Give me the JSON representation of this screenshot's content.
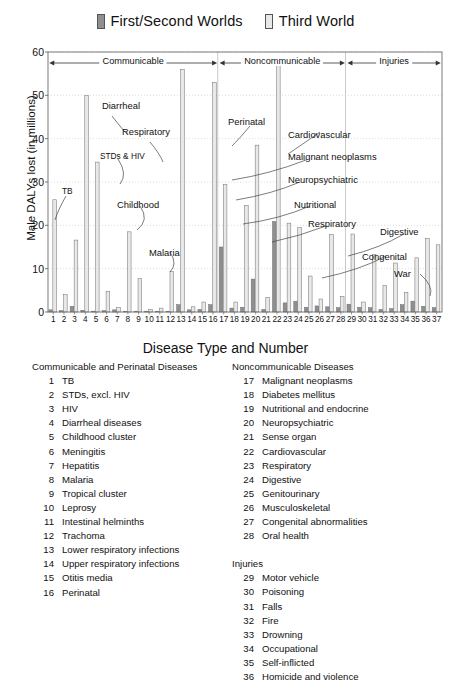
{
  "legend": {
    "items": [
      {
        "label": "First/Second Worlds",
        "color": "#8f8f8f",
        "icon": "legend-swatch-dark"
      },
      {
        "label": "Third World",
        "color": "#e8e8e8",
        "icon": "legend-swatch-light"
      }
    ]
  },
  "axis_title_x": "Disease Type and Number",
  "axis_title_y": "Male DALYs lost (in millions)",
  "bands": [
    {
      "label": "Communicable",
      "from": 1,
      "to": 16
    },
    {
      "label": "Noncommunicable",
      "from": 17,
      "to": 28
    },
    {
      "label": "Injuries",
      "from": 29,
      "to": 37
    }
  ],
  "annotations": [
    {
      "label": "TB",
      "x": 62,
      "y": 186
    },
    {
      "label": "Diarrheal",
      "x": 102,
      "y": 100
    },
    {
      "label": "Respiratory",
      "x": 122,
      "y": 126
    },
    {
      "label": "STDs & HIV",
      "x": 100,
      "y": 151
    },
    {
      "label": "Childhood",
      "x": 117,
      "y": 199
    },
    {
      "label": "Malaria",
      "x": 149,
      "y": 247
    },
    {
      "label": "Perinatal",
      "x": 228,
      "y": 116
    },
    {
      "label": "Cardiovascular",
      "x": 288,
      "y": 129
    },
    {
      "label": "Malignant neoplasms",
      "x": 288,
      "y": 151
    },
    {
      "label": "Neuropsychiatric",
      "x": 288,
      "y": 174
    },
    {
      "label": "Nutritional",
      "x": 294,
      "y": 199
    },
    {
      "label": "Respiratory",
      "x": 308,
      "y": 218
    },
    {
      "label": "Digestive",
      "x": 380,
      "y": 226
    },
    {
      "label": "Congenital",
      "x": 362,
      "y": 251
    },
    {
      "label": "War",
      "x": 394,
      "y": 268
    }
  ],
  "lists": {
    "left": {
      "heading": "Communicable and Perinatal Diseases",
      "items": [
        {
          "num": "1",
          "name": "TB"
        },
        {
          "num": "2",
          "name": "STDs, excl. HIV"
        },
        {
          "num": "3",
          "name": "HIV"
        },
        {
          "num": "4",
          "name": "Diarrheal diseases"
        },
        {
          "num": "5",
          "name": "Childhood cluster"
        },
        {
          "num": "6",
          "name": "Meningitis"
        },
        {
          "num": "7",
          "name": "Hepatitis"
        },
        {
          "num": "8",
          "name": "Malaria"
        },
        {
          "num": "9",
          "name": "Tropical cluster"
        },
        {
          "num": "10",
          "name": "Leprosy"
        },
        {
          "num": "11",
          "name": "Intestinal helminths"
        },
        {
          "num": "12",
          "name": "Trachoma"
        },
        {
          "num": "13",
          "name": "Lower respiratory infections"
        },
        {
          "num": "14",
          "name": "Upper respiratory infections"
        },
        {
          "num": "15",
          "name": "Otitis media"
        },
        {
          "num": "16",
          "name": "Perinatal"
        }
      ]
    },
    "right": {
      "heading": "Noncommunicable Diseases",
      "items": [
        {
          "num": "17",
          "name": "Malignant neoplasms"
        },
        {
          "num": "18",
          "name": "Diabetes mellitus"
        },
        {
          "num": "19",
          "name": "Nutritional and endocrine"
        },
        {
          "num": "20",
          "name": "Neuropsychiatric"
        },
        {
          "num": "21",
          "name": "Sense organ"
        },
        {
          "num": "22",
          "name": "Cardiovascular"
        },
        {
          "num": "23",
          "name": "Respiratory"
        },
        {
          "num": "24",
          "name": "Digestive"
        },
        {
          "num": "25",
          "name": "Genitourinary"
        },
        {
          "num": "26",
          "name": "Musculoskeletal"
        },
        {
          "num": "27",
          "name": "Congenital abnormalities"
        },
        {
          "num": "28",
          "name": "Oral health"
        }
      ],
      "heading2": "Injuries",
      "items2": [
        {
          "num": "29",
          "name": "Motor vehicle"
        },
        {
          "num": "30",
          "name": "Poisoning"
        },
        {
          "num": "31",
          "name": "Falls"
        },
        {
          "num": "32",
          "name": "Fire"
        },
        {
          "num": "33",
          "name": "Drowning"
        },
        {
          "num": "34",
          "name": "Occupational"
        },
        {
          "num": "35",
          "name": "Self-inflicted"
        },
        {
          "num": "36",
          "name": "Homicide and violence"
        }
      ]
    }
  },
  "chart_data": {
    "type": "bar",
    "title": "",
    "xlabel": "Disease Type and Number",
    "ylabel": "Male DALYs lost (in millions)",
    "ylim": [
      0,
      60
    ],
    "yticks": [
      0,
      10,
      20,
      30,
      40,
      50,
      60
    ],
    "grid": true,
    "legend_position": "top-center",
    "categories": [
      "1",
      "2",
      "3",
      "4",
      "5",
      "6",
      "7",
      "8",
      "9",
      "10",
      "11",
      "12",
      "13",
      "14",
      "15",
      "16",
      "17",
      "18",
      "19",
      "20",
      "21",
      "22",
      "23",
      "24",
      "25",
      "26",
      "27",
      "28",
      "29",
      "30",
      "31",
      "32",
      "33",
      "34",
      "35",
      "36",
      "37"
    ],
    "series": [
      {
        "name": "First/Second Worlds",
        "color": "#8f8f8f",
        "values": [
          0.5,
          0.3,
          1.3,
          0.4,
          0.2,
          0.3,
          0.5,
          0.1,
          0.1,
          0.05,
          0.1,
          0.05,
          1.7,
          0.5,
          0.6,
          1.7,
          15.0,
          0.9,
          1.1,
          7.6,
          0.6,
          20.9,
          2.1,
          2.5,
          1.1,
          1.4,
          1.2,
          1.0,
          1.8,
          1.1,
          1.0,
          0.6,
          0.8,
          1.7,
          2.5,
          1.3,
          1.0
        ]
      },
      {
        "name": "Third World",
        "color": "#e8e8e8",
        "values": [
          25.9,
          4.0,
          16.6,
          50.0,
          34.6,
          4.8,
          1.0,
          18.5,
          7.7,
          0.6,
          0.9,
          9.3,
          56.0,
          1.2,
          2.3,
          53.0,
          29.4,
          2.3,
          24.6,
          38.5,
          3.4,
          58.0,
          20.5,
          19.5,
          8.3,
          3.0,
          17.9,
          3.6,
          18.0,
          2.3,
          13.3,
          6.1,
          11.3,
          4.5,
          12.5,
          17.0,
          15.5
        ]
      }
    ]
  }
}
